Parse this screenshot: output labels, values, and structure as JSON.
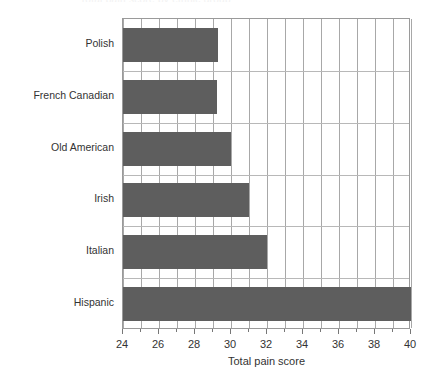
{
  "clipped_title_text": "Total pain score by ethnic group",
  "axis": {
    "x_title": "Total pain score",
    "x_min": 24,
    "x_max": 40,
    "x_tick_labels": [
      "24",
      "26",
      "28",
      "30",
      "32",
      "34",
      "36",
      "38",
      "40"
    ]
  },
  "chart_data": {
    "type": "bar",
    "orientation": "horizontal",
    "title": "",
    "xlabel": "Total pain score",
    "ylabel": "",
    "xlim": [
      24,
      40
    ],
    "grid": true,
    "legend": false,
    "bar_color": "#5e5e5e",
    "grid_color": "#a8a8a8",
    "axis_color": "#9a9a9a",
    "text_color": "#333333",
    "categories": [
      "Polish",
      "French Canadian",
      "Old American",
      "Irish",
      "Italian",
      "Hispanic"
    ],
    "values": [
      29.3,
      29.2,
      30.0,
      31.0,
      32.0,
      40.0
    ],
    "major_tick_step": 2,
    "minor_tick_step": 1
  }
}
